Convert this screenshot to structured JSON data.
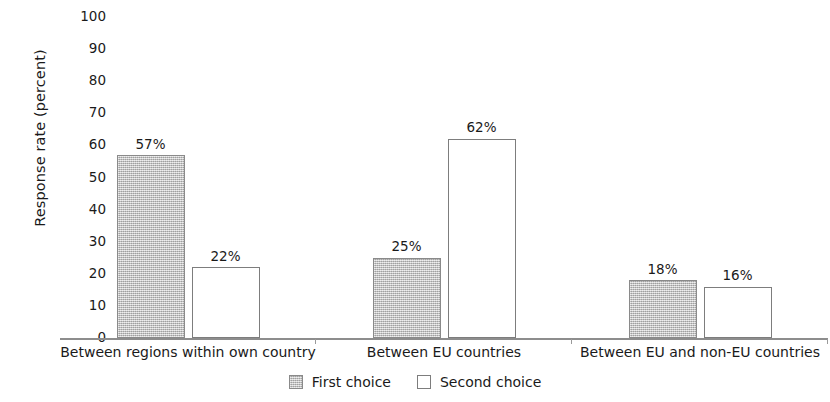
{
  "chart_data": {
    "type": "bar",
    "title": "",
    "xlabel": "",
    "ylabel": "Response rate (percent)",
    "ylim": [
      0,
      100
    ],
    "ytick_step": 10,
    "yticks": [
      100,
      90,
      80,
      70,
      60,
      50,
      40,
      30,
      20,
      10,
      0
    ],
    "grid": false,
    "legend_position": "bottom-center",
    "value_label_suffix": "%",
    "categories": [
      "Between regions within own country",
      "Between EU countries",
      "Between EU and non-EU countries"
    ],
    "series": [
      {
        "name": "First choice",
        "values": [
          57,
          25,
          18
        ],
        "value_labels": [
          "57%",
          "25%",
          "18%"
        ],
        "fill": "#c2c2c2",
        "stroke": "#8a8a8a",
        "pattern": "speckled-gray"
      },
      {
        "name": "Second choice",
        "values": [
          22,
          62,
          16
        ],
        "value_labels": [
          "22%",
          "62%",
          "16%"
        ],
        "fill": "#ffffff",
        "stroke": "#7d7d7d",
        "pattern": "solid-white"
      }
    ]
  },
  "axis": {
    "line_color": "#8d8d8d"
  },
  "legend": {
    "items": [
      {
        "label": "First choice",
        "swatch": "first"
      },
      {
        "label": "Second choice",
        "swatch": "second"
      }
    ]
  }
}
